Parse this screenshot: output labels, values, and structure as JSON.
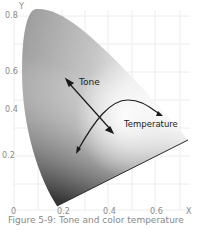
{
  "figure": {
    "caption": "Figure 5-9: Tone and color temperature",
    "axes": {
      "x_label": "X",
      "y_label": "Y",
      "x_ticks": [
        "0",
        "0.2",
        "0.4",
        "0.6"
      ],
      "y_ticks": [
        "0.8",
        "0.6",
        "0.4",
        "0.2"
      ]
    },
    "annotations": {
      "tone": "Tone",
      "temperature": "Temperature"
    },
    "colors": {
      "grid": "#ececec",
      "tick_text": "#8a8a8a",
      "arrow": "#1a1a1a",
      "gamut_light": "#f2f2f2",
      "gamut_mid": "#a8a8a8",
      "gamut_dark": "#3a3a3a"
    }
  }
}
